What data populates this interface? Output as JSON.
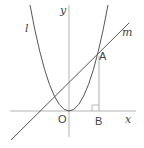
{
  "diagram": {
    "curves": [
      {
        "id": "l",
        "type": "parabola",
        "label": "l"
      },
      {
        "id": "m",
        "type": "line",
        "label": "m"
      }
    ],
    "axes": {
      "x_label": "x",
      "y_label": "y",
      "origin_label": "O"
    },
    "points": [
      {
        "label": "A",
        "description": "intersection of l and m"
      },
      {
        "label": "B",
        "description": "foot of perpendicular from A to x-axis"
      }
    ],
    "colors": {
      "stroke": "#555555",
      "axis": "#999999",
      "text": "#444444"
    }
  }
}
